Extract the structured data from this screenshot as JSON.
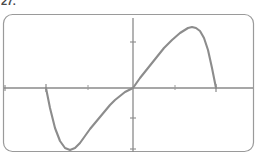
{
  "figure": {
    "label": "27.",
    "caption": ""
  },
  "frame": {
    "border_color": "#9a9a9a",
    "corner_radius": 9,
    "x": 3,
    "y": 14,
    "width": 251,
    "height": 138
  },
  "axes": {
    "axis_color": "#8a8a8a",
    "origin_x": 133,
    "origin_y": 88,
    "x_axis": {
      "start_x": 4,
      "end_x": 253,
      "y": 88
    },
    "y_axis": {
      "x": 133,
      "start_y": 18,
      "end_y": 152
    },
    "x_ticks": [
      4,
      46,
      88,
      175,
      216
    ],
    "y_ticks": [
      42,
      118,
      148
    ],
    "tick_length": 7
  },
  "chart_data": {
    "type": "line",
    "title": "",
    "subtitle": "",
    "xlabel": "",
    "ylabel": "",
    "grid": false,
    "legend": null,
    "series": [
      {
        "name": "curve",
        "color": "#8c8c8c",
        "line_width": 2.1,
        "description": "sine-like wave: zero at left start, minimum, zero at origin, maximum, steep drop to zero at right end",
        "x": [
          46,
          50,
          55,
          60,
          65,
          70,
          75,
          80,
          85,
          90,
          95,
          100,
          105,
          110,
          115,
          120,
          125,
          133,
          140,
          148,
          156,
          164,
          172,
          180,
          188,
          192,
          196,
          200,
          204,
          208,
          212,
          216
        ],
        "y": [
          88,
          108,
          128,
          141,
          148,
          150,
          148,
          143,
          136,
          129,
          123,
          117,
          111,
          105,
          100,
          96,
          92,
          88,
          78,
          68,
          58,
          48,
          40,
          33,
          28,
          27,
          28,
          31,
          38,
          50,
          68,
          88
        ]
      }
    ],
    "annotations": [],
    "xlim": [
      4,
      253
    ],
    "ylim": [
      152,
      18
    ]
  }
}
